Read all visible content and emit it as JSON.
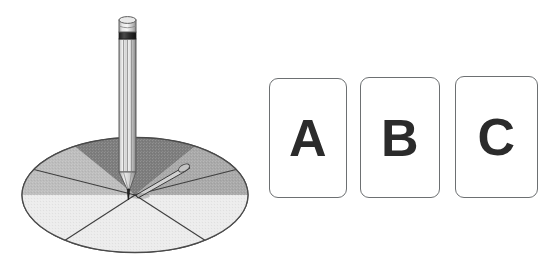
{
  "scene": {
    "title": "Spinner with three lettered cards",
    "background_color": "#ffffff",
    "width": 551,
    "height": 272
  },
  "spinner": {
    "name": "four-section-spinner",
    "shape": "ellipse",
    "section_count": 4,
    "outline_color": "#4a4a4a",
    "center": {
      "x": 135,
      "y": 195
    },
    "sections": [
      {
        "id": "top",
        "label": "",
        "position": "top",
        "color": "#7d7d7d",
        "shade": "dark gray"
      },
      {
        "id": "right",
        "label": "",
        "position": "right",
        "color": "#a9a9a9",
        "shade": "medium gray"
      },
      {
        "id": "bottom",
        "label": "",
        "position": "bottom",
        "color": "#ececec",
        "shade": "very light gray"
      },
      {
        "id": "left",
        "label": "",
        "position": "left",
        "color": "#bdbdbd",
        "shade": "light gray"
      }
    ],
    "pointer": {
      "name": "spinner-arrow",
      "direction": "upper-right",
      "color": "#55585a"
    }
  },
  "pencil": {
    "name": "pencil",
    "orientation": "vertical",
    "tip_position": "spinner center",
    "body_color": "#c8c8c8",
    "cap_color": "#d6d6d6",
    "ferrule_color": "#2e2e2e",
    "tip_color": "#2a2a2a"
  },
  "cards": {
    "count": 3,
    "border_color": "#6d7072",
    "fill_color": "#ffffff",
    "text_color": "#2b2b2b",
    "items": [
      {
        "id": "a",
        "label": "A"
      },
      {
        "id": "b",
        "label": "B"
      },
      {
        "id": "c",
        "label": "C"
      }
    ]
  }
}
